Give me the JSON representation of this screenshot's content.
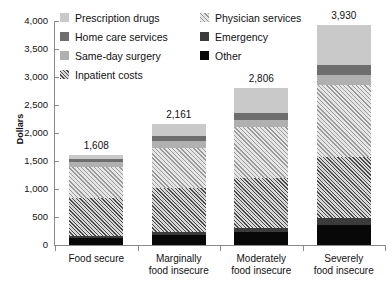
{
  "chart_data": {
    "type": "bar",
    "stacked": true,
    "title": "",
    "xlabel": "",
    "ylabel": "Dollars",
    "ylim": [
      0,
      4000
    ],
    "ytick_labels": [
      "0",
      "500",
      "1,000",
      "1,500",
      "2,000",
      "2,500",
      "3,000",
      "3,500",
      "4,000"
    ],
    "ytick_values": [
      0,
      500,
      1000,
      1500,
      2000,
      2500,
      3000,
      3500,
      4000
    ],
    "grid": false,
    "legend_position": "top",
    "categories": [
      "Food secure",
      "Marginally food insecure",
      "Moderately food insecure",
      "Severely food insecure"
    ],
    "category_lines": [
      [
        "Food secure"
      ],
      [
        "Marginally",
        "food insecure"
      ],
      [
        "Moderately",
        "food insecure"
      ],
      [
        "Severely",
        "food insecure"
      ]
    ],
    "totals": [
      1608,
      2161,
      2806,
      3930
    ],
    "total_labels": [
      "1,608",
      "2,161",
      "2,806",
      "3,930"
    ],
    "series": [
      {
        "name": "Other",
        "swatch": "solid-black",
        "color": "#080808",
        "values": [
          130,
          185,
          230,
          360
        ]
      },
      {
        "name": "Emergency",
        "swatch": "solid-darkgray",
        "color": "#3b3b3b",
        "values": [
          35,
          55,
          75,
          120
        ]
      },
      {
        "name": "Inpatient costs",
        "swatch": "dark-hatch",
        "color": "#4a4a4a",
        "values": [
          680,
          780,
          900,
          1090
        ]
      },
      {
        "name": "Physician services",
        "swatch": "light-hatch",
        "color": "#9a9a9a",
        "values": [
          540,
          720,
          900,
          1280
        ]
      },
      {
        "name": "Same-day surgery",
        "swatch": "solid-midgray",
        "color": "#b0b0b0",
        "values": [
          95,
          115,
          135,
          185
        ]
      },
      {
        "name": "Home care services",
        "swatch": "solid-gray",
        "color": "#6e6e6e",
        "values": [
          58,
          96,
          116,
          185
        ]
      },
      {
        "name": "Prescription drugs",
        "swatch": "solid-lightgray",
        "color": "#c9c9c9",
        "values": [
          70,
          210,
          450,
          710
        ]
      }
    ],
    "legend": [
      {
        "label": "Prescription drugs",
        "swatch": "solid-lightgray"
      },
      {
        "label": "Physician services",
        "swatch": "light-hatch"
      },
      {
        "label": "Home care services",
        "swatch": "solid-gray"
      },
      {
        "label": "Emergency",
        "swatch": "solid-darkgray"
      },
      {
        "label": "Same-day surgery",
        "swatch": "solid-midgray"
      },
      {
        "label": "Other",
        "swatch": "solid-black"
      },
      {
        "label": "Inpatient costs",
        "swatch": "dark-hatch"
      }
    ]
  }
}
